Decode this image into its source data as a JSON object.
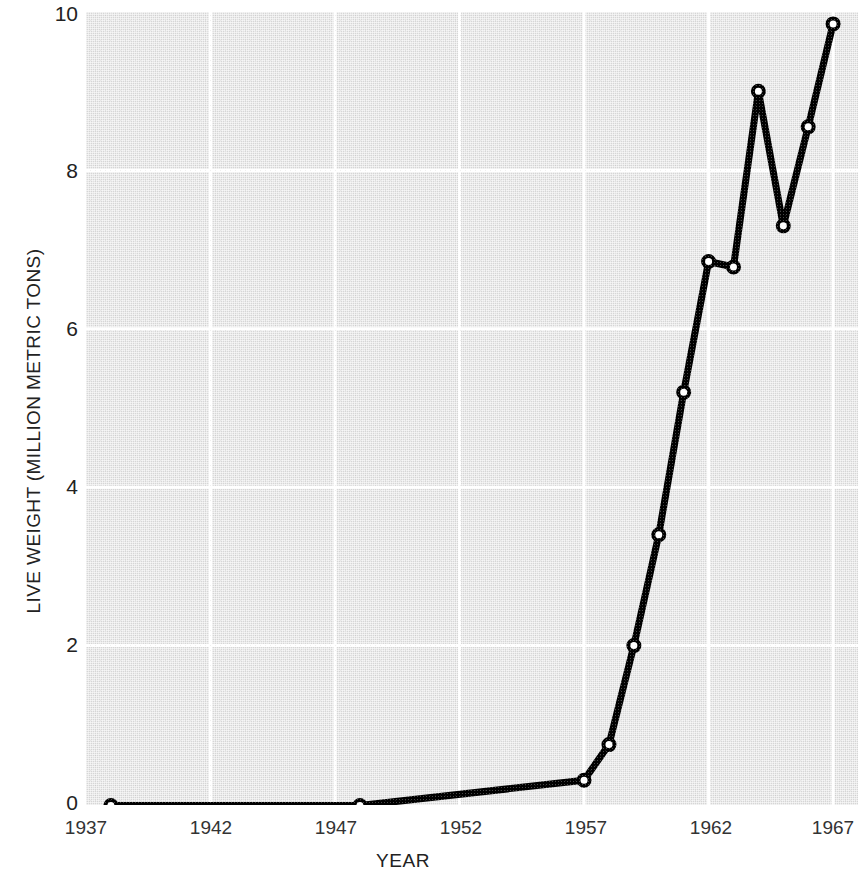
{
  "chart_data": {
    "type": "line",
    "title": "",
    "xlabel": "YEAR",
    "ylabel": "LIVE WEIGHT (MILLION METRIC TONS)",
    "xlim": [
      1937,
      1968
    ],
    "ylim": [
      0,
      10
    ],
    "xticks": [
      1937,
      1942,
      1947,
      1952,
      1957,
      1962,
      1967
    ],
    "xtick_labels": [
      "1937",
      "1942",
      "1947",
      "1952",
      "1957",
      "1962",
      "1967"
    ],
    "yticks": [
      0,
      2,
      4,
      6,
      8,
      10
    ],
    "ytick_labels": [
      "0",
      "2",
      "4",
      "6",
      "8",
      "10"
    ],
    "grid": true,
    "grid_color": "#ffffff",
    "plot_background": "#d6d6d6",
    "line_color": "#000000",
    "marker": "open-circle",
    "marker_face_color": "#ffffff",
    "legend": "none",
    "x": [
      1938,
      1948,
      1957,
      1958,
      1959,
      1960,
      1961,
      1962,
      1963,
      1964,
      1965,
      1966,
      1967,
      1968
    ],
    "values": [
      -0.02,
      -0.02,
      0.3,
      0.75,
      2.0,
      3.4,
      5.2,
      6.85,
      6.78,
      9.0,
      7.3,
      8.55,
      9.85,
      9.85
    ],
    "series": [
      {
        "name": "Live weight landings",
        "points": [
          {
            "x": 1938,
            "y": -0.02
          },
          {
            "x": 1948,
            "y": -0.02
          },
          {
            "x": 1957,
            "y": 0.3
          },
          {
            "x": 1958,
            "y": 0.75
          },
          {
            "x": 1959,
            "y": 2.0
          },
          {
            "x": 1960,
            "y": 3.4
          },
          {
            "x": 1961,
            "y": 5.2
          },
          {
            "x": 1962,
            "y": 6.85
          },
          {
            "x": 1963,
            "y": 6.78
          },
          {
            "x": 1964,
            "y": 9.0
          },
          {
            "x": 1965,
            "y": 7.3
          },
          {
            "x": 1966,
            "y": 8.55
          },
          {
            "x": 1967,
            "y": 9.85
          }
        ]
      }
    ]
  },
  "axes": {
    "y_title": "LIVE WEIGHT (MILLION METRIC TONS)",
    "x_title": "YEAR",
    "y_labels": [
      "10",
      "8",
      "6",
      "4",
      "2",
      "0"
    ],
    "x_labels": [
      "1937",
      "1942",
      "1947",
      "1952",
      "1957",
      "1962",
      "1967"
    ]
  }
}
